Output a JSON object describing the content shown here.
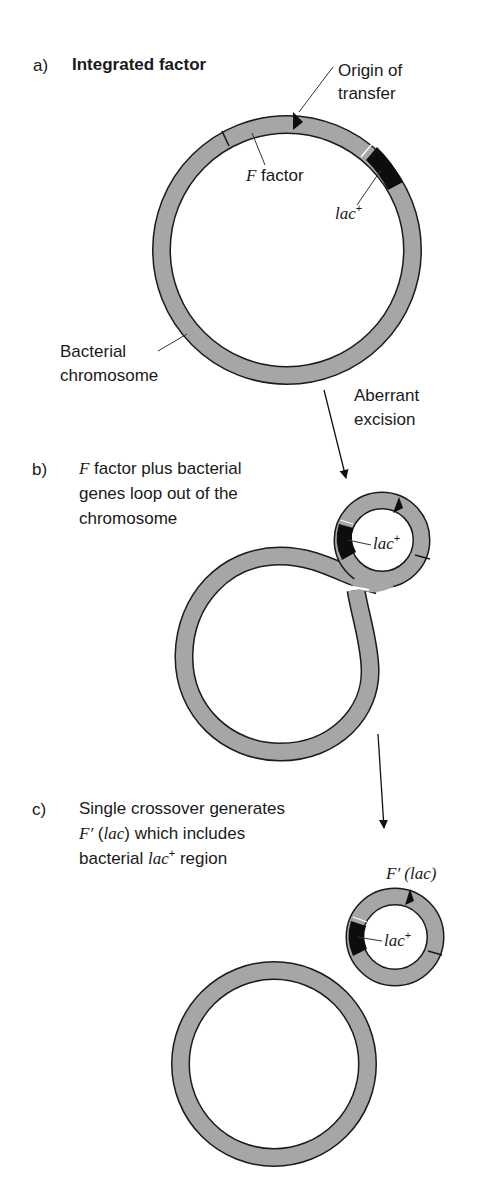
{
  "panel_a": {
    "letter": "a)",
    "title": "Integrated factor",
    "labels": {
      "origin_line1": "Origin of",
      "origin_line2": "transfer",
      "f_factor_italic": "F",
      "f_factor_rest": " factor",
      "lac": "lac",
      "lac_sup": "+",
      "bacterial_line1": "Bacterial",
      "bacterial_line2": "chromosome"
    },
    "arrow_label_line1": "Aberrant",
    "arrow_label_line2": "excision"
  },
  "panel_b": {
    "letter": "b)",
    "line1_italic": "F",
    "line1_rest": " factor plus bacterial",
    "line2": "genes loop out of the",
    "line3": "chromosome",
    "lac": "lac",
    "lac_sup": "+"
  },
  "panel_c": {
    "letter": "c)",
    "line1": "Single crossover generates",
    "line2_italic": "F′ (lac)",
    "line2_prefix_italic": "F′",
    "line2_paren_open": " (",
    "line2_lac": "lac",
    "line2_rest": ") which includes",
    "line3_prefix": "bacterial ",
    "line3_lac": "lac",
    "line3_sup": "+",
    "line3_rest": " region",
    "plasmid_label": "F′ (lac)",
    "lac": "lac",
    "lac_sup": "+"
  },
  "colors": {
    "ring_fill": "#a6a6a6",
    "ring_stroke": "#1a1a1a",
    "lac_region": "#0d0d0d",
    "background": "#ffffff"
  }
}
